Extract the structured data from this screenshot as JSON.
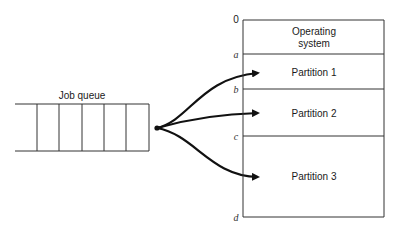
{
  "queue": {
    "label": "Job queue",
    "slots": 6
  },
  "memory": {
    "addresses": [
      "0",
      "a",
      "b",
      "c",
      "d"
    ],
    "regions": [
      {
        "label_line1": "Operating",
        "label_line2": "system"
      },
      {
        "label": "Partition 1"
      },
      {
        "label": "Partition 2"
      },
      {
        "label": "Partition 3"
      }
    ]
  },
  "colors": {
    "stroke": "#333333",
    "arrow": "#111111",
    "background": "#ffffff"
  }
}
